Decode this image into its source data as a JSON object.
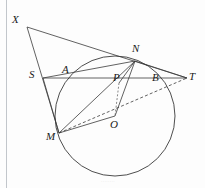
{
  "figure": {
    "width": 205,
    "height": 188,
    "background_color": "#fdfdfd",
    "stroke_color": "#3a3a3a",
    "label_color": "#1a1a1a",
    "watermark_text": "········"
  },
  "circle": {
    "center_label": "O",
    "center_x": 115,
    "center_y": 116,
    "radius": 60,
    "style": "solid"
  },
  "points": [
    {
      "id": "X",
      "label": "X",
      "x": 27,
      "y": 27,
      "label_x": 12,
      "label_y": 14
    },
    {
      "id": "S",
      "label": "S",
      "x": 43,
      "y": 78,
      "label_x": 29,
      "label_y": 69
    },
    {
      "id": "A",
      "label": "A",
      "x": 68,
      "y": 78,
      "label_x": 62,
      "label_y": 64
    },
    {
      "id": "N",
      "label": "N",
      "x": 135,
      "y": 61,
      "label_x": 132,
      "label_y": 43
    },
    {
      "id": "P",
      "label": "P",
      "x": 119,
      "y": 83,
      "label_x": 113,
      "label_y": 72
    },
    {
      "id": "B",
      "label": "B",
      "x": 156,
      "y": 78,
      "label_x": 152,
      "label_y": 72
    },
    {
      "id": "T",
      "label": "T",
      "x": 187,
      "y": 78,
      "label_x": 189,
      "label_y": 71
    },
    {
      "id": "M",
      "label": "M",
      "x": 59,
      "y": 133,
      "label_x": 46,
      "label_y": 131
    },
    {
      "id": "O",
      "label": "O",
      "x": 115,
      "y": 116,
      "label_x": 110,
      "label_y": 119
    }
  ],
  "segments": [
    {
      "name": "X-T",
      "from": "X",
      "to": "T",
      "style": "solid"
    },
    {
      "name": "X-M",
      "from": "X",
      "to": "M",
      "style": "solid"
    },
    {
      "name": "S-T",
      "from": "S",
      "to": "T",
      "style": "solid"
    },
    {
      "name": "S-N",
      "from": "S",
      "to": "N",
      "style": "solid"
    },
    {
      "name": "S-M",
      "from": "S",
      "to": "M",
      "style": "solid"
    },
    {
      "name": "M-N",
      "from": "M",
      "to": "N",
      "style": "solid"
    },
    {
      "name": "M-O",
      "from": "M",
      "to": "O",
      "style": "solid"
    },
    {
      "name": "N-O",
      "from": "N",
      "to": "O",
      "style": "solid"
    },
    {
      "name": "N-T",
      "from": "N",
      "to": "T",
      "style": "solid"
    },
    {
      "name": "M-T",
      "from": "M",
      "to": "T",
      "style": "dashed"
    },
    {
      "name": "P-O",
      "from": "P",
      "to": "O",
      "style": "dashed"
    },
    {
      "name": "N-P",
      "from": "N",
      "to": "P",
      "style": "solid"
    }
  ]
}
